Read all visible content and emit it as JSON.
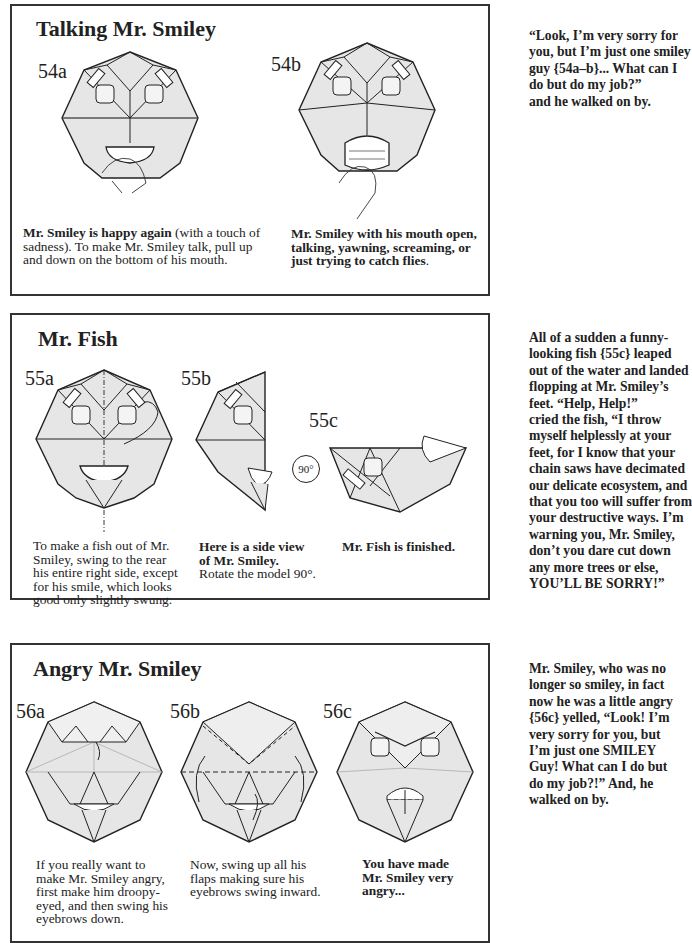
{
  "sections": [
    {
      "title": "Talking Mr. Smiley",
      "steps": [
        "54a",
        "54b"
      ],
      "captions": [
        {
          "bold": "Mr. Smiley is happy again",
          "line1_rest": " (with a touch of",
          "line2": "sadness). To make Mr. Smiley talk, pull up",
          "line3": "and down on the bottom of his mouth."
        },
        {
          "line1": "Mr. Smiley with his mouth open,",
          "line2": "talking, yawning, screaming, or",
          "line3": "just trying to catch flies",
          "line3_tail": "."
        }
      ],
      "side_text": [
        "“Look, I’m very sorry for",
        "you, but I’m just one smiley",
        "guy {54a–b}... What can I",
        "do but do my job?”",
        "and he walked on by."
      ]
    },
    {
      "title": "Mr. Fish",
      "steps": [
        "55a",
        "55b",
        "55c"
      ],
      "rotate_label": "90°",
      "captions": [
        {
          "lines": [
            "To make a fish out of Mr.",
            "Smiley, swing to the rear",
            "his entire right side, except",
            "for his smile, which looks",
            "good only slightly swung."
          ]
        },
        {
          "bold1": "Here is a side view",
          "bold2": "of Mr. Smiley.",
          "line3": "Rotate the model 90°."
        },
        {
          "bold": "Mr. Fish is finished."
        }
      ],
      "side_text": [
        "All of a sudden a funny-",
        "looking fish {55c} leaped",
        "out of the water and landed",
        "flopping at Mr. Smiley’s",
        "feet.  “Help, Help!”",
        "cried the fish,  “I throw",
        "myself helplessly at your",
        "feet, for I know that your",
        "chain saws have decimated",
        "our delicate ecosystem, and",
        "that you too will suffer from",
        "your destructive ways.  I’m",
        "warning you, Mr. Smiley,",
        "don’t you dare cut down",
        "any more trees or else,",
        "YOU’LL BE SORRY!”"
      ]
    },
    {
      "title": "Angry Mr. Smiley",
      "steps": [
        "56a",
        "56b",
        "56c"
      ],
      "captions": [
        {
          "lines": [
            "If you really want to",
            "make Mr. Smiley angry,",
            "first make him droopy-",
            "eyed, and then swing his",
            "eyebrows down."
          ]
        },
        {
          "lines": [
            "Now, swing up all his",
            "flaps making sure his",
            "eyebrows swing inward."
          ]
        },
        {
          "bold_lines": [
            "You have made",
            "Mr. Smiley very",
            "angry..."
          ]
        }
      ],
      "side_text": [
        "Mr. Smiley, who was no",
        "longer so smiley, in fact",
        "now he was a little angry",
        "{56c} yelled, “Look!  I’m",
        "very sorry for you, but",
        "I’m just one SMILEY",
        "Guy!  What can I do but",
        "do my job?!”  And, he",
        "walked on by."
      ]
    }
  ],
  "colors": {
    "paper_fill": "#e6e6e6",
    "line": "#222222",
    "border": "#333333"
  }
}
